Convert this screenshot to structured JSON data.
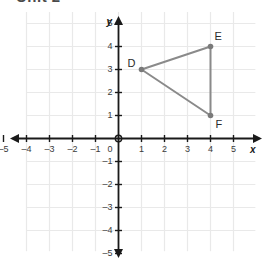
{
  "header": {
    "title": "Unit 2"
  },
  "colors": {
    "grid": "#e9e9e9",
    "axis": "#1a1a1a",
    "shape_stroke": "#8a8a8a",
    "vertex_dot": "#7a7a7a",
    "label_text": "#2a2a2a",
    "background": "#ffffff"
  },
  "chart_data": {
    "type": "scatter",
    "title": "Unit 2",
    "xlabel": "x",
    "ylabel": "y",
    "xlim": [
      -5.8,
      5.8
    ],
    "ylim": [
      -5.8,
      5.8
    ],
    "grid": true,
    "grid_step": 1,
    "legend": "none",
    "x_ticks": [
      -5,
      -4,
      -3,
      -2,
      -1,
      1,
      2,
      3,
      4,
      5
    ],
    "y_ticks": [
      5,
      4,
      3,
      2,
      1,
      -1,
      -2,
      -3,
      -4,
      -5
    ],
    "x_tick_labels": [
      "-5",
      "-4",
      "-3",
      "-2",
      "-1",
      "1",
      "2",
      "3",
      "4",
      "5"
    ],
    "y_tick_labels": [
      "5",
      "4",
      "3",
      "2",
      "1",
      "-1",
      "-2",
      "-3",
      "-4",
      "-5"
    ],
    "origin_label": "0",
    "shapes": [
      {
        "name": "triangle-DEF",
        "type": "polygon",
        "closed": true,
        "vertices": [
          {
            "label": "D",
            "x": 1,
            "y": 3,
            "label_dx": -14,
            "label_dy": -12
          },
          {
            "label": "E",
            "x": 4,
            "y": 4,
            "label_dx": 4,
            "label_dy": -16
          },
          {
            "label": "F",
            "x": 4,
            "y": 1,
            "label_dx": 5,
            "label_dy": 3
          }
        ]
      }
    ]
  },
  "axes": {
    "x_axis_label": "x",
    "y_axis_label": "y",
    "origin": "0"
  },
  "points": {
    "d": {
      "label": "D",
      "coords": "(1, 3)"
    },
    "e": {
      "label": "E",
      "coords": "(4, 4)"
    },
    "f": {
      "label": "F",
      "coords": "(4, 1)"
    }
  }
}
